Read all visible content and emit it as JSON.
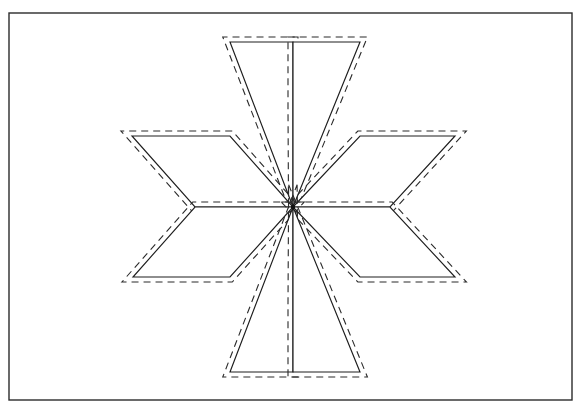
{
  "document": {
    "title": "Eight-Pointed Star Quilt Block Pattern",
    "kind": "line-drawing",
    "background_color": "#ffffff",
    "ink_color": "#1e1e1e"
  },
  "page_border": {
    "name": "page-border",
    "x": 9,
    "y": 13,
    "width": 563,
    "height": 387,
    "stroke_color": "#2b2b2b",
    "stroke_width": 1.4,
    "fill": "none"
  },
  "figure": {
    "name": "eight-pointed-star",
    "center": {
      "x": 293,
      "y": 207
    },
    "point_count": 8,
    "outline_stroke_color": "#1e1e1e",
    "outline_stroke_width": 1.15,
    "stitch_stroke_color": "#2a2a2a",
    "stitch_stroke_width": 1.1,
    "stitch_dash_pattern": "7 5",
    "stitch_inset_px": 5,
    "center_dot": {
      "x": 293,
      "y": 207,
      "radius": 2.2,
      "color": "#101010"
    },
    "diamonds": [
      {
        "id": "diamond-n-w",
        "label": "upper-left vertical diamond",
        "points": "293,207 230,42 293,42 293,110"
      },
      {
        "id": "diamond-n-e",
        "label": "upper-right vertical diamond",
        "points": "293,207 293,110 293,42 360,42"
      },
      {
        "id": "diamond-w-n",
        "label": "upper-left horizontal diamond",
        "points": "293,207 195,207 132,136 230,136"
      },
      {
        "id": "diamond-e-n",
        "label": "upper-right horizontal diamond",
        "points": "293,207 360,136 455,136 390,207"
      },
      {
        "id": "diamond-w-s",
        "label": "lower-left horizontal diamond",
        "points": "293,207 195,207 133,277 230,277"
      },
      {
        "id": "diamond-e-s",
        "label": "lower-right horizontal diamond",
        "points": "293,207 390,207 455,277 360,277"
      },
      {
        "id": "diamond-s-w",
        "label": "lower-left vertical diamond",
        "points": "293,207 293,304 293,372 230,372"
      },
      {
        "id": "diamond-s-e",
        "label": "lower-right vertical diamond",
        "points": "293,207 360,372 293,372 293,304"
      }
    ]
  },
  "chart_data": {
    "type": "diagram",
    "shape": "8-point LeMoyne star",
    "units": "pixels",
    "center": [
      293,
      207
    ],
    "outer_tips": [
      {
        "name": "top-left-tip",
        "x": 230,
        "y": 42
      },
      {
        "name": "top-right-tip",
        "x": 360,
        "y": 42
      },
      {
        "name": "left-upper-tip",
        "x": 132,
        "y": 136
      },
      {
        "name": "right-upper-tip",
        "x": 455,
        "y": 136
      },
      {
        "name": "left-lower-tip",
        "x": 133,
        "y": 277
      },
      {
        "name": "right-lower-tip",
        "x": 455,
        "y": 277
      },
      {
        "name": "bottom-left-tip",
        "x": 230,
        "y": 372
      },
      {
        "name": "bottom-right-tip",
        "x": 360,
        "y": 372
      }
    ],
    "inner_notches": [
      {
        "name": "top-notch",
        "x": 293,
        "y": 110
      },
      {
        "name": "left-notch",
        "x": 195,
        "y": 207
      },
      {
        "name": "right-notch",
        "x": 390,
        "y": 207
      },
      {
        "name": "bottom-notch",
        "x": 293,
        "y": 304
      }
    ],
    "line_styles": [
      "solid outline",
      "dashed stitching line"
    ]
  }
}
